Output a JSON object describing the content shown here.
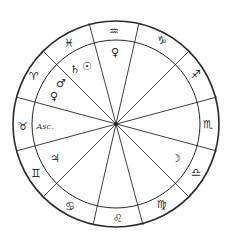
{
  "chart": {
    "type": "astrological-horoscope-wheel",
    "houses": 12,
    "colors": {
      "line": "#2a2a2a",
      "background": "#ffffff"
    },
    "signs": [
      {
        "name": "aquarius",
        "glyph": "♒"
      },
      {
        "name": "capricorn",
        "glyph": "♑"
      },
      {
        "name": "sagittarius",
        "glyph": "♐"
      },
      {
        "name": "scorpio",
        "glyph": "♏"
      },
      {
        "name": "libra",
        "glyph": "♎"
      },
      {
        "name": "virgo",
        "glyph": "♍"
      },
      {
        "name": "leo",
        "glyph": "♌"
      },
      {
        "name": "cancer",
        "glyph": "♋"
      },
      {
        "name": "gemini",
        "glyph": "♊"
      },
      {
        "name": "taurus",
        "glyph": "♉"
      },
      {
        "name": "aries",
        "glyph": "♈"
      },
      {
        "name": "pisces",
        "glyph": "♓"
      }
    ],
    "planets": [
      {
        "name": "venus-aquarius",
        "glyph": "♀"
      },
      {
        "name": "saturn",
        "glyph": "♄"
      },
      {
        "name": "sun",
        "glyph": "☉"
      },
      {
        "name": "mars",
        "glyph": "♂"
      },
      {
        "name": "venus-aries",
        "glyph": "♀"
      },
      {
        "name": "jupiter",
        "glyph": "♃"
      },
      {
        "name": "moon",
        "glyph": "☽"
      }
    ],
    "ascendant_label": "Asc."
  }
}
